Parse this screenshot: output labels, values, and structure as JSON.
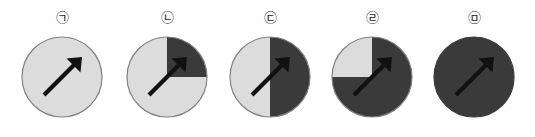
{
  "figure": {
    "title": "",
    "background_color": "#ffffff",
    "light_color": "#dcdcdc",
    "dark_color": "#3a3a3a",
    "outline_color": "#808080",
    "arrow_color": "#111111",
    "arrow_direction_degrees": 45,
    "arrow_direction_label": "up-right"
  },
  "panels": [
    {
      "label": "㉠",
      "label_name": "circled-giyeok",
      "shaded_fraction_percent": 0,
      "shaded_description": "none",
      "arrow": "up-right"
    },
    {
      "label": "㉡",
      "label_name": "circled-nieun",
      "shaded_fraction_percent": 25,
      "shaded_description": "upper-right quadrant",
      "arrow": "up-right"
    },
    {
      "label": "㉢",
      "label_name": "circled-digeut",
      "shaded_fraction_percent": 50,
      "shaded_description": "right half",
      "arrow": "up-right"
    },
    {
      "label": "㉣",
      "label_name": "circled-rieul",
      "shaded_fraction_percent": 75,
      "shaded_description": "all but upper-left quadrant",
      "arrow": "up-right"
    },
    {
      "label": "㉤",
      "label_name": "circled-mieum",
      "shaded_fraction_percent": 100,
      "shaded_description": "entire circle",
      "arrow": "up-right"
    }
  ]
}
